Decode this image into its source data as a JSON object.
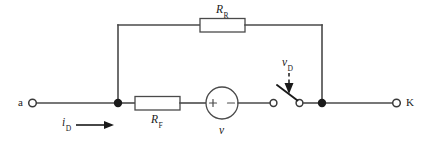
{
  "diagram": {
    "type": "electrical-circuit-schematic",
    "title": "",
    "terminals": [
      {
        "id": "left",
        "label": "a",
        "style": "open-circle",
        "x": 30,
        "y": 103
      },
      {
        "id": "right",
        "label": "K",
        "style": "open-circle",
        "x": 399,
        "y": 103
      }
    ],
    "components": [
      {
        "id": "resistor-top",
        "kind": "resistor",
        "symbol": "rectangle-box",
        "label_base": "R",
        "label_sub": "R",
        "branch": "upper-parallel-branch"
      },
      {
        "id": "resistor-bottom",
        "kind": "resistor",
        "symbol": "rectangle-box",
        "label_base": "R",
        "label_sub": "F",
        "branch": "lower-series-branch"
      },
      {
        "id": "voltage-source",
        "kind": "voltage-source",
        "symbol": "circle",
        "label_base": "v",
        "label_sub": "",
        "plus_sign": "+",
        "minus_sign": "−",
        "plus_side": "left",
        "minus_side": "right",
        "branch": "lower-series-branch"
      },
      {
        "id": "switch",
        "kind": "switch",
        "symbol": "spst-open",
        "state": "open",
        "label_base": "v",
        "label_sub": "D",
        "branch": "lower-series-branch"
      }
    ],
    "annotations": [
      {
        "id": "input-current",
        "label_base": "i",
        "label_sub": "D",
        "arrow": "horizontal-right",
        "near": "left-terminal-wire"
      },
      {
        "id": "switch-voltage-pointer",
        "label_base": "v",
        "label_sub": "D",
        "arrow": "dashed-down",
        "points_to": "switch"
      }
    ],
    "nodes": [
      {
        "id": "node-left",
        "style": "filled-dot",
        "x": 118,
        "y": 103
      },
      {
        "id": "node-right",
        "style": "filled-dot",
        "x": 322,
        "y": 103
      }
    ],
    "colors": {
      "wire": "#4a4a4a",
      "ink": "#1a1a1a",
      "background": "#ffffff"
    }
  }
}
